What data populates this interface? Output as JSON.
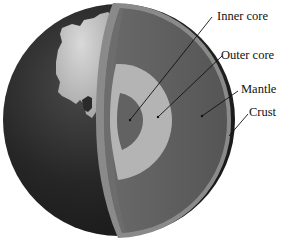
{
  "diagram": {
    "labels": [
      {
        "id": "inner-core",
        "text": "Inner core"
      },
      {
        "id": "outer-core",
        "text": "Outer core"
      },
      {
        "id": "mantle",
        "text": "Mantle"
      },
      {
        "id": "crust",
        "text": "Crust"
      }
    ],
    "colors": {
      "background": "#ffffff",
      "ocean": "#2b2b2b",
      "continent": "#bdbdbd",
      "crust": "#8a8a8a",
      "mantle": "#5c5c5c",
      "outer_core": "#b4b4b4",
      "inner_core": "#626262",
      "leader_line": "#111111"
    }
  }
}
